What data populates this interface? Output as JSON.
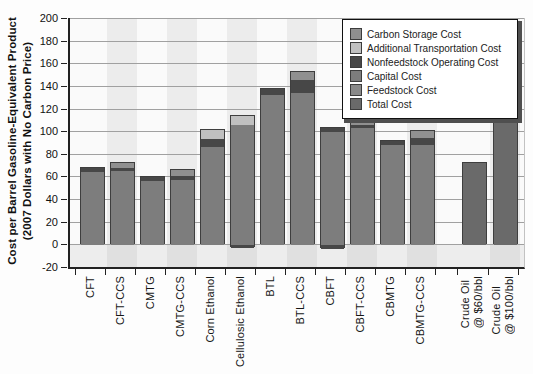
{
  "chart_data": {
    "type": "bar",
    "stacked": true,
    "ylabel": "Cost per Barrel Gasoline-Equivalent Product\n(2007 Dollars with No Carbon Price)",
    "ylim": [
      -20,
      200
    ],
    "yticks": [
      -20,
      0,
      20,
      40,
      60,
      80,
      100,
      120,
      140,
      160,
      180,
      200
    ],
    "grid": true,
    "legend_position": "top-right",
    "legend": [
      {
        "label": "Carbon Storage Cost",
        "color": "#909090"
      },
      {
        "label": "Additional Transportation Cost",
        "color": "#c0c0c0"
      },
      {
        "label": "Nonfeedstock Operating Cost",
        "color": "#474747"
      },
      {
        "label": "Capital Cost",
        "color": "#7d7d7d"
      },
      {
        "label": "Feedstock Cost",
        "color": "#8a8a8a"
      },
      {
        "label": "Total Cost",
        "color": "#6a6a6a"
      }
    ],
    "categories": [
      "CFT",
      "CFT-CCS",
      "CMTG",
      "CMTG-CCS",
      "Corn Ethanol",
      "Cellulosic Ethanol",
      "BTL",
      "BTL-CCS",
      "CBFT",
      "CBFT-CCS",
      "CBMTG",
      "CBMTG-CCS",
      "Crude Oil\n@ $60/bbl",
      "Crude Oil\n@ $100/bbl"
    ],
    "bars": [
      {
        "label": "CFT",
        "total": 68,
        "segments": [
          {
            "legend": "Capital Cost",
            "value": 65
          },
          {
            "legend": "Nonfeedstock Operating Cost",
            "value": 3
          }
        ]
      },
      {
        "label": "CFT-CCS",
        "total": 73,
        "segments": [
          {
            "legend": "Capital Cost",
            "value": 66
          },
          {
            "legend": "Nonfeedstock Operating Cost",
            "value": 2
          },
          {
            "legend": "Carbon Storage Cost",
            "value": 5
          }
        ]
      },
      {
        "label": "CMTG",
        "total": 60,
        "segments": [
          {
            "legend": "Capital Cost",
            "value": 57
          },
          {
            "legend": "Nonfeedstock Operating Cost",
            "value": 3
          }
        ]
      },
      {
        "label": "CMTG-CCS",
        "total": 67,
        "segments": [
          {
            "legend": "Capital Cost",
            "value": 58
          },
          {
            "legend": "Nonfeedstock Operating Cost",
            "value": 3
          },
          {
            "legend": "Carbon Storage Cost",
            "value": 6
          }
        ]
      },
      {
        "label": "Corn Ethanol",
        "total": 102,
        "segments": [
          {
            "legend": "Capital Cost",
            "value": 87
          },
          {
            "legend": "Nonfeedstock Operating Cost",
            "value": 7
          },
          {
            "legend": "Additional Transportation Cost",
            "value": 8
          }
        ]
      },
      {
        "label": "Cellulosic Ethanol",
        "total": 114,
        "segments": [
          {
            "legend": "Nonfeedstock Operating Cost",
            "value": -2
          },
          {
            "legend": "Capital Cost",
            "value": 106
          },
          {
            "legend": "Additional Transportation Cost",
            "value": 8
          }
        ]
      },
      {
        "label": "BTL",
        "total": 138,
        "segments": [
          {
            "legend": "Capital Cost",
            "value": 133
          },
          {
            "legend": "Nonfeedstock Operating Cost",
            "value": 5
          }
        ]
      },
      {
        "label": "BTL-CCS",
        "total": 153,
        "segments": [
          {
            "legend": "Capital Cost",
            "value": 135
          },
          {
            "legend": "Nonfeedstock Operating Cost",
            "value": 11
          },
          {
            "legend": "Carbon Storage Cost",
            "value": 7
          }
        ]
      },
      {
        "label": "CBFT",
        "total": 104,
        "segments": [
          {
            "legend": "Nonfeedstock Operating Cost",
            "value": -3
          },
          {
            "legend": "Capital Cost",
            "value": 100
          },
          {
            "legend": "Nonfeedstock Operating Cost",
            "value": 4
          }
        ]
      },
      {
        "label": "CBFT-CCS",
        "total": 114,
        "segments": [
          {
            "legend": "Capital Cost",
            "value": 104
          },
          {
            "legend": "Nonfeedstock Operating Cost",
            "value": 2
          },
          {
            "legend": "Carbon Storage Cost",
            "value": 8
          }
        ]
      },
      {
        "label": "CBMTG",
        "total": 92,
        "segments": [
          {
            "legend": "Capital Cost",
            "value": 89
          },
          {
            "legend": "Nonfeedstock Operating Cost",
            "value": 3
          }
        ]
      },
      {
        "label": "CBMTG-CCS",
        "total": 101,
        "segments": [
          {
            "legend": "Capital Cost",
            "value": 89
          },
          {
            "legend": "Nonfeedstock Operating Cost",
            "value": 6
          },
          {
            "legend": "Carbon Storage Cost",
            "value": 6
          }
        ]
      },
      {
        "label": "Crude Oil\n@ $60/bbl",
        "total": 73,
        "segments": [
          {
            "legend": "Total Cost",
            "value": 73
          }
        ]
      },
      {
        "label": "Crude Oil\n@ $100/bbl",
        "total": 115,
        "segments": [
          {
            "legend": "Total Cost",
            "value": 115
          }
        ]
      }
    ]
  }
}
